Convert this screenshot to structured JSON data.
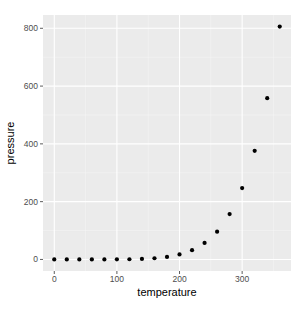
{
  "chart_data": {
    "type": "scatter",
    "title": "",
    "xlabel": "temperature",
    "ylabel": "pressure",
    "x": [
      0,
      20,
      40,
      60,
      80,
      100,
      120,
      140,
      160,
      180,
      200,
      220,
      240,
      260,
      280,
      300,
      320,
      340,
      360
    ],
    "y": [
      0.0002,
      0.0012,
      0.006,
      0.03,
      0.09,
      0.27,
      0.75,
      1.85,
      4.2,
      8.8,
      17.3,
      32.1,
      57,
      96,
      157,
      247,
      376,
      558,
      806
    ],
    "xlim": [
      -18,
      378
    ],
    "ylim": [
      -40,
      846
    ],
    "x_ticks": [
      0,
      100,
      200,
      300
    ],
    "x_tick_labels": [
      "0",
      "100",
      "200",
      "300"
    ],
    "y_ticks": [
      0,
      200,
      400,
      600,
      800
    ],
    "y_tick_labels": [
      "0",
      "200",
      "400",
      "600",
      "800"
    ],
    "grid": true,
    "legend": null,
    "colors": {
      "panel_bg": "#ebebeb",
      "grid_major": "#ffffff",
      "point": "#000000",
      "tick_text": "#4d4d4d"
    }
  }
}
